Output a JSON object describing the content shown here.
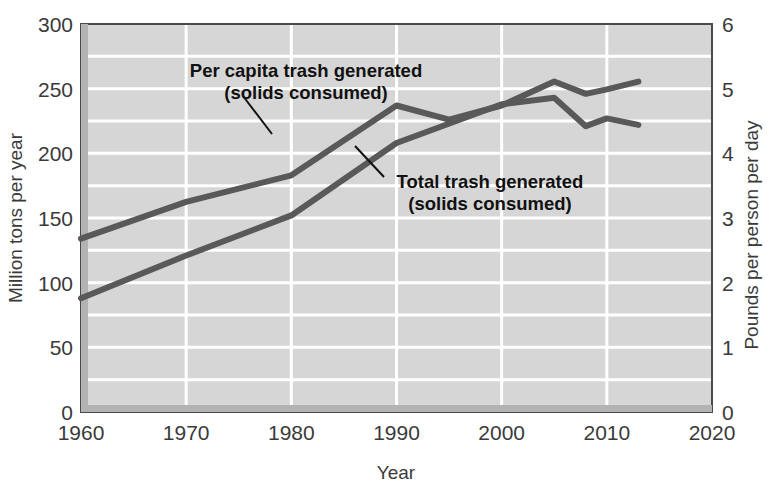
{
  "chart_data": {
    "type": "line",
    "title": "",
    "xlabel": "Year",
    "ylabel": "Million tons per year",
    "y2label": "Pounds per person per day",
    "xlim": [
      1960,
      2020
    ],
    "ylim": [
      0,
      300
    ],
    "y2lim": [
      0,
      6
    ],
    "xticks": [
      1960,
      1970,
      1980,
      1990,
      2000,
      2010,
      2020
    ],
    "xtick_labels": [
      "1960",
      "1970",
      "1980",
      "1990",
      "2000",
      "2010",
      "2020"
    ],
    "yticks": [
      0,
      50,
      100,
      150,
      200,
      250,
      300
    ],
    "ytick_labels": [
      "0",
      "50",
      "100",
      "150",
      "200",
      "250",
      "300"
    ],
    "y2ticks": [
      0,
      1,
      2,
      3,
      4,
      5,
      6
    ],
    "y2tick_labels": [
      "0",
      "1",
      "2",
      "3",
      "4",
      "5",
      "6"
    ],
    "grid": true,
    "grid_color": "#ffffff",
    "plot_bg": "#d6d6d6",
    "line_color": "#595959",
    "legend_position": "inline-annotation",
    "series": [
      {
        "name": "Per capita trash generated (solids consumed)",
        "axis": "right",
        "units": "pounds per person per day",
        "x": [
          1960,
          1970,
          1980,
          1990,
          1995,
          2000,
          2005,
          2008,
          2010,
          2013
        ],
        "values": [
          2.68,
          3.25,
          3.66,
          4.74,
          4.52,
          4.74,
          5.11,
          4.92,
          4.99,
          5.11
        ]
      },
      {
        "name": "Total trash generated (solids consumed)",
        "axis": "left",
        "units": "million tons per year",
        "x": [
          1960,
          1970,
          1980,
          1990,
          2000,
          2005,
          2008,
          2010,
          2013
        ],
        "values": [
          88,
          121,
          152,
          208,
          238,
          243,
          221,
          227,
          222
        ]
      }
    ],
    "annotations": [
      {
        "id": "per-capita",
        "line1": "Per capita trash generated",
        "line2": "(solids consumed)"
      },
      {
        "id": "total-trash",
        "line1": "Total trash generated",
        "line2": "(solids consumed)"
      }
    ]
  }
}
